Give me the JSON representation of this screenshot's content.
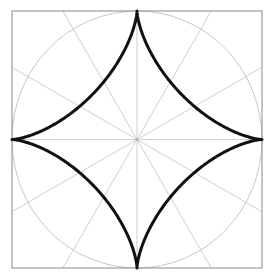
{
  "figure": {
    "title": "Astroid inscribed in a square with polar grid",
    "background_color": "#ffffff",
    "canvas": {
      "width": 271,
      "height": 278
    }
  },
  "frame": {
    "name": "bounding-square",
    "x": 12,
    "y": 11,
    "width": 250,
    "height": 257,
    "stroke_color": "#8a8a8a",
    "stroke_width": 1,
    "fill": "none"
  },
  "grid": {
    "name": "polar-grid",
    "stroke_color": "#cfcfcf",
    "stroke_width": 1,
    "center": {
      "x": 137,
      "y": 139.5
    },
    "circle": {
      "name": "grid-circle",
      "radius_x": 125,
      "radius_y": 128.5,
      "stroke_color": "#c8c8c8",
      "stroke_width": 1
    },
    "radial_lines": {
      "count": 12,
      "spacing_degrees": 30,
      "angles_degrees": [
        0,
        30,
        60,
        90,
        120,
        150,
        180,
        210,
        240,
        270,
        300,
        330
      ],
      "extent": "to-square-border"
    },
    "center_dot": {
      "name": "grid-center-dot",
      "radius": 1.6,
      "color": "#b0b0b0"
    }
  },
  "curve": {
    "name": "astroid-curve",
    "type": "astroid",
    "description": "four-cusped hypocycloid x^(2/3) + y^(2/3) = a^(2/3)",
    "cusp_count": 4,
    "cusps": [
      {
        "label": "top",
        "x": 137,
        "y": 11
      },
      {
        "label": "right",
        "x": 262,
        "y": 139.5
      },
      {
        "label": "bottom",
        "x": 137,
        "y": 268
      },
      {
        "label": "left",
        "x": 12,
        "y": 139.5
      }
    ],
    "semi_axis_x": 125,
    "semi_axis_y": 128.5,
    "stroke_color": "#111111",
    "stroke_width": 3,
    "fill": "none"
  },
  "chart_data": {
    "type": "line",
    "title": "Astroid inscribed in a square with polar grid",
    "xlabel": "",
    "ylabel": "",
    "xlim": [
      -1,
      1
    ],
    "ylim": [
      -1,
      1
    ],
    "grid": true,
    "legend": "none",
    "series": [
      {
        "name": "astroid",
        "parametric": true,
        "equation": "x = a*cos(t)^3, y = a*sin(t)^3",
        "a": 1,
        "points_t_degrees": [
          0,
          30,
          60,
          90,
          120,
          150,
          180,
          210,
          240,
          270,
          300,
          330,
          360
        ],
        "x": [
          1.0,
          0.6495,
          0.125,
          0.0,
          -0.125,
          -0.6495,
          -1.0,
          -0.6495,
          -0.125,
          0.0,
          0.125,
          0.6495,
          1.0
        ],
        "y": [
          0.0,
          0.125,
          0.6495,
          1.0,
          0.6495,
          0.125,
          0.0,
          -0.125,
          -0.6495,
          -1.0,
          -0.6495,
          -0.125,
          0.0
        ]
      },
      {
        "name": "unit-circle",
        "parametric": true,
        "equation": "x = cos(t), y = sin(t)",
        "radius": 1
      }
    ],
    "annotations": [
      {
        "name": "bounding-square",
        "shape": "rect",
        "x0": -1,
        "y0": -1,
        "x1": 1,
        "y1": 1
      },
      {
        "name": "radial-spokes",
        "count": 12,
        "spacing_degrees": 30
      }
    ]
  }
}
